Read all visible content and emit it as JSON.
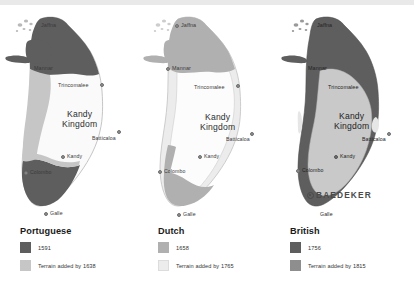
{
  "figure": {
    "top_band_color": "#e9e9e9",
    "background": "#ffffff"
  },
  "shared": {
    "kingdom_line1": "Kandy",
    "kingdom_line2": "Kingdom",
    "cities": {
      "jaffna": "Jaffna",
      "mannar": "Mannar",
      "trincomalee": "Trincomalee",
      "batticaloa": "Batticaloa",
      "kandy": "Kandy",
      "colombo": "Colombo",
      "galle": "Galle"
    }
  },
  "panels": [
    {
      "id": "portuguese",
      "legend": {
        "title": "Portuguese",
        "entries": [
          {
            "label": "1591",
            "color": "#5e5e5e"
          },
          {
            "label": "Terrain added by 1638",
            "color": "#c6c6c6"
          }
        ]
      },
      "map": {
        "early_color": "#5e5e5e",
        "added_color": "#c6c6c6",
        "interior_color": "#fafafa",
        "outline_color": "#b6b6b6"
      }
    },
    {
      "id": "dutch",
      "legend": {
        "title": "Dutch",
        "entries": [
          {
            "label": "1658",
            "color": "#b0b0b0"
          },
          {
            "label": "Terrain added by 1765",
            "color": "#ececec"
          }
        ]
      },
      "map": {
        "early_color": "#b0b0b0",
        "added_color": "#ececec",
        "interior_color": "#fcfcfc",
        "outline_color": "#c2c2c2"
      }
    },
    {
      "id": "british",
      "legend": {
        "title": "British",
        "entries": [
          {
            "label": "1756",
            "color": "#5e5e5e"
          },
          {
            "label": "Terrain added by 1815",
            "color": "#8e8e8e"
          }
        ]
      },
      "map": {
        "early_color": "#5e5e5e",
        "added_color": "#8e8e8e",
        "interior_color": "#c9c9c9",
        "outline_color": "#9a9a9a"
      },
      "watermark": "BAEDEKER"
    }
  ]
}
